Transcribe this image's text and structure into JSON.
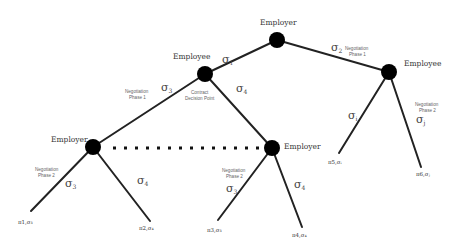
{
  "diagram": {
    "type": "game-tree",
    "nodes": {
      "root": {
        "label": "Employer"
      },
      "employee_left": {
        "label": "Employee",
        "note_line1": "Contract",
        "note_line2": "Decision Point"
      },
      "employee_right": {
        "label": "Employee"
      },
      "employer_left": {
        "label": "Employer"
      },
      "employer_mid": {
        "label": "Employer"
      }
    },
    "edges": {
      "root_left": {
        "sigma": "σ",
        "sub": "1"
      },
      "root_right": {
        "sigma": "σ",
        "sub": "2",
        "phase_line1": "Negotiation",
        "phase_line2": "Phase 1"
      },
      "emp_left_left": {
        "sigma": "σ",
        "sub": "3",
        "phase_line1": "Negotiation",
        "phase_line2": "Phase 1"
      },
      "emp_left_right": {
        "sigma": "σ",
        "sub": "4"
      },
      "er_left_left": {
        "sigma": "σ",
        "sub": "3",
        "phase_line1": "Negotiation",
        "phase_line2": "Phase 2"
      },
      "er_left_right": {
        "sigma": "σ",
        "sub": "4"
      },
      "er_mid_left": {
        "sigma": "σ",
        "sub": "3",
        "phase_line1": "Negotiation",
        "phase_line2": "Phase 2"
      },
      "er_mid_right": {
        "sigma": "σ",
        "sub": "4"
      },
      "ee_right_left": {
        "sigma": "σ",
        "sub": "i"
      },
      "ee_right_right": {
        "sigma": "σ",
        "sub": "j",
        "phase_line1": "Negotiation",
        "phase_line2": "Phase 2"
      }
    },
    "leaves": [
      {
        "text": "π1,σ₃"
      },
      {
        "text": "π2,σ₄"
      },
      {
        "text": "π3,σ₃"
      },
      {
        "text": "π4,σ₄"
      },
      {
        "text": "π5,σᵢ"
      },
      {
        "text": "π6,σⱼ"
      }
    ],
    "information_set": {
      "style": "dotted",
      "connects": [
        "employer_left",
        "employer_mid"
      ]
    }
  }
}
